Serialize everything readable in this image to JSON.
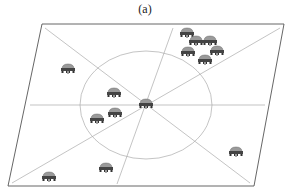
{
  "figure": {
    "label": "(a)",
    "colors": {
      "border": "#555555",
      "guide_lines": "#aaaaaa",
      "circle": "#aaaaaa",
      "robot_body": "#8a8a8a",
      "robot_dark": "#333333"
    },
    "plane": {
      "corners": [
        [
          42,
          24
        ],
        [
          284,
          24
        ],
        [
          254,
          186
        ],
        [
          8,
          186
        ]
      ]
    },
    "center": [
      146,
      105
    ],
    "circle": {
      "cx": 146,
      "cy": 105,
      "rx": 66,
      "ry": 54
    },
    "guide_lines": [
      [
        [
          30,
          105
        ],
        [
          265,
          105
        ]
      ],
      [
        [
          45,
          28
        ],
        [
          250,
          183
        ]
      ],
      [
        [
          173,
          28
        ],
        [
          117,
          184
        ]
      ],
      [
        [
          280,
          28
        ],
        [
          12,
          183
        ]
      ]
    ],
    "robots": [
      {
        "id": "center-robot",
        "x": 146,
        "y": 104,
        "icon": "robot-icon"
      },
      {
        "id": "robot-1",
        "x": 68,
        "y": 69,
        "icon": "robot-icon"
      },
      {
        "id": "robot-2",
        "x": 187,
        "y": 33,
        "icon": "robot-icon"
      },
      {
        "id": "robot-3",
        "x": 196,
        "y": 41,
        "icon": "robot-icon"
      },
      {
        "id": "robot-4",
        "x": 210,
        "y": 41,
        "icon": "robot-icon"
      },
      {
        "id": "robot-5",
        "x": 188,
        "y": 52,
        "icon": "robot-icon"
      },
      {
        "id": "robot-6",
        "x": 217,
        "y": 51,
        "icon": "robot-icon"
      },
      {
        "id": "robot-7",
        "x": 205,
        "y": 60,
        "icon": "robot-icon"
      },
      {
        "id": "robot-8",
        "x": 114,
        "y": 93,
        "icon": "robot-icon"
      },
      {
        "id": "robot-9",
        "x": 115,
        "y": 113,
        "icon": "robot-icon"
      },
      {
        "id": "robot-10",
        "x": 97,
        "y": 119,
        "icon": "robot-icon"
      },
      {
        "id": "robot-11",
        "x": 236,
        "y": 152,
        "icon": "robot-icon"
      },
      {
        "id": "robot-12",
        "x": 106,
        "y": 168,
        "icon": "robot-icon"
      },
      {
        "id": "robot-13",
        "x": 49,
        "y": 177,
        "icon": "robot-icon"
      }
    ]
  }
}
